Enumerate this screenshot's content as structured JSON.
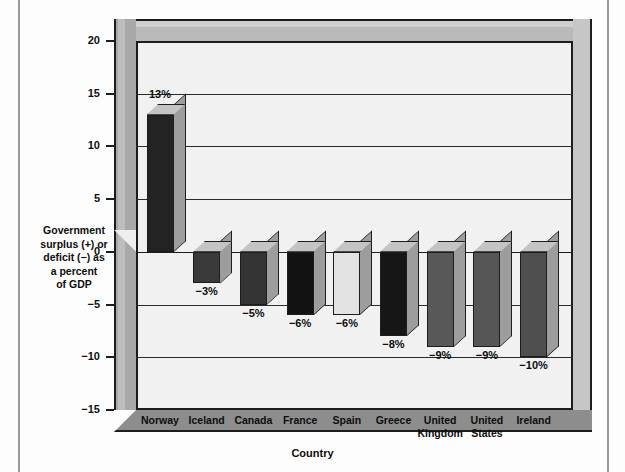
{
  "chart_data": {
    "type": "bar",
    "title": "",
    "xlabel": "Country",
    "ylabel": "Government surplus (+) or deficit (−) as a percent of GDP",
    "ylabel_lines": [
      "Government",
      "surplus (+) or",
      "deficit (−) as",
      "a percent",
      "of GDP"
    ],
    "categories": [
      "Norway",
      "Iceland",
      "Canada",
      "France",
      "Spain",
      "Greece",
      "United Kingdom",
      "United States",
      "Ireland"
    ],
    "category_lines": [
      [
        "Norway"
      ],
      [
        "Iceland"
      ],
      [
        "Canada"
      ],
      [
        "France"
      ],
      [
        "Spain"
      ],
      [
        "Greece"
      ],
      [
        "United",
        "Kingdom"
      ],
      [
        "United",
        "States"
      ],
      [
        "Ireland"
      ]
    ],
    "values": [
      13,
      -3,
      -5,
      -6,
      -6,
      -8,
      -9,
      -9,
      -10
    ],
    "data_labels": [
      "13%",
      "−3%",
      "−5%",
      "−6%",
      "−6%",
      "−8%",
      "−9%",
      "−9%",
      "−10%"
    ],
    "bar_colors": [
      "#232323",
      "#3a3a3a",
      "#343434",
      "#121212",
      "#e3e3e3",
      "#161616",
      "#585858",
      "#565656",
      "#4f4f4f"
    ],
    "ylim": [
      -15,
      20
    ],
    "yticks": [
      20,
      15,
      10,
      5,
      0,
      -5,
      -10,
      -15
    ],
    "ytick_labels": [
      "20",
      "15",
      "10",
      "5",
      "0",
      "−5",
      "−10",
      "−15"
    ],
    "grid": true,
    "legend": "none",
    "style": "3d-bar",
    "units": "percent of GDP"
  },
  "palette": {
    "panel_background": "#f1f1f1",
    "axis_line": "#1d1d1d",
    "gridline": "#2a2a2a",
    "wall_left": "#a8a8a8",
    "wall_top": "#b9b9b9",
    "wall_right": "#c6c6c6",
    "floor": "#8d8d8d",
    "bar_top_face": "#c4c4c4",
    "bar_side_face": "#9d9d9d",
    "page_background": "#fdfdfd",
    "text": "#0d0d0d"
  }
}
